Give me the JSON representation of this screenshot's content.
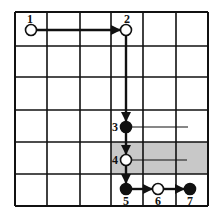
{
  "diagram": {
    "type": "grid-path",
    "grid": {
      "cols": 6,
      "rows": 6,
      "x_lines": [
        15,
        47,
        80,
        111,
        143,
        176,
        208
      ],
      "y_lines": [
        12,
        46,
        77,
        110,
        142,
        174,
        206
      ],
      "line_color": "#111111"
    },
    "shaded_region": {
      "x": 111,
      "y": 142,
      "width": 97,
      "height": 32,
      "color": "#c8c8c8"
    },
    "nodes": [
      {
        "id": "1",
        "label": "1",
        "x": 31,
        "y": 30,
        "style": "open",
        "label_dx": -4,
        "label_dy": -7
      },
      {
        "id": "2",
        "label": "2",
        "x": 126,
        "y": 30,
        "style": "open",
        "label_dx": -2,
        "label_dy": -7
      },
      {
        "id": "3",
        "label": "3",
        "x": 126,
        "y": 127,
        "style": "filled",
        "label_dx": -14,
        "label_dy": 4
      },
      {
        "id": "4",
        "label": "4",
        "x": 126,
        "y": 160,
        "style": "open",
        "label_dx": -14,
        "label_dy": 4
      },
      {
        "id": "5",
        "label": "5",
        "x": 126,
        "y": 189,
        "style": "filled",
        "label_dx": -3,
        "label_dy": 16
      },
      {
        "id": "6",
        "label": "6",
        "x": 158,
        "y": 189,
        "style": "open",
        "label_dx": -3,
        "label_dy": 16
      },
      {
        "id": "7",
        "label": "7",
        "x": 190,
        "y": 189,
        "style": "filled",
        "label_dx": -3,
        "label_dy": 16
      }
    ],
    "edges": [
      {
        "from": "1",
        "to": "2",
        "arrow": true
      },
      {
        "from": "2",
        "to": "3",
        "arrow": true
      },
      {
        "from": "3",
        "to": "4",
        "arrow": true
      },
      {
        "from": "4",
        "to": "5",
        "arrow": true
      },
      {
        "from": "5",
        "to": "6",
        "arrow": true
      },
      {
        "from": "6",
        "to": "7",
        "arrow": true
      }
    ],
    "branches": [
      {
        "from": "3",
        "x2": 188
      },
      {
        "from": "4",
        "x2": 187
      }
    ]
  }
}
